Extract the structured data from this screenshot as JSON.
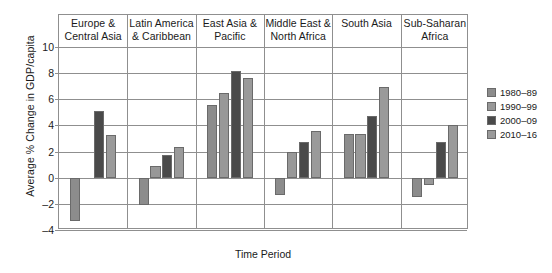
{
  "chart_data": {
    "type": "bar",
    "title": "",
    "xlabel": "Time Period",
    "ylabel": "Average % Change in GDP/capita",
    "ylim": [
      -4,
      10
    ],
    "yticks": [
      10,
      8,
      6,
      4,
      2,
      0,
      -2,
      -4
    ],
    "ytick_labels": [
      "10",
      "8",
      "6",
      "4",
      "2",
      "0",
      "–2",
      "–4"
    ],
    "grid": true,
    "legend_position": "right",
    "categories": [
      "Europe & Central Asia",
      "Latin America & Caribbean",
      "East Asia & Pacific",
      "Middle East & North Africa",
      "South Asia",
      "Sub-Saharan Africa"
    ],
    "category_lines": [
      [
        "Europe &",
        "Central Asia"
      ],
      [
        "Latin America",
        "& Caribbean"
      ],
      [
        "East Asia &",
        "Pacific"
      ],
      [
        "Middle East &",
        "North Africa"
      ],
      [
        "South Asia",
        ""
      ],
      [
        "Sub-Saharan",
        "Africa"
      ]
    ],
    "series": [
      {
        "name": "1980–89",
        "color": "#8c8c8c",
        "values": [
          -3.3,
          -2.1,
          5.6,
          -1.35,
          3.35,
          -1.5
        ]
      },
      {
        "name": "1990–99",
        "color": "#989898",
        "values": [
          null,
          0.9,
          6.5,
          2.0,
          3.35,
          -0.55
        ]
      },
      {
        "name": "2000–09",
        "color": "#4a4a4a",
        "values": [
          5.1,
          1.75,
          8.2,
          2.75,
          4.75,
          2.75
        ]
      },
      {
        "name": "2010–16",
        "color": "#9a9a9a",
        "values": [
          3.3,
          2.35,
          7.6,
          3.6,
          6.95,
          4.0
        ]
      }
    ]
  },
  "legend": {
    "items": [
      {
        "label": "1980–89",
        "color": "#8c8c8c"
      },
      {
        "label": "1990–99",
        "color": "#989898"
      },
      {
        "label": "2000–09",
        "color": "#4a4a4a"
      },
      {
        "label": "2010–16",
        "color": "#9a9a9a"
      }
    ]
  }
}
